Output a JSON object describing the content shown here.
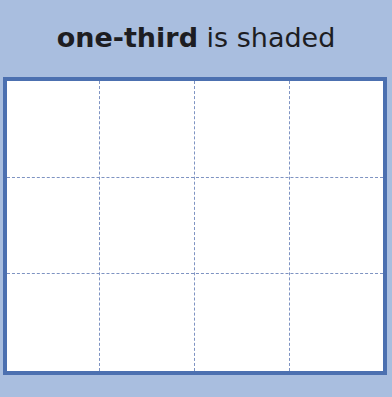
{
  "title": {
    "bold_part": "one-third",
    "rest": " is shaded"
  },
  "grid": {
    "rows": 3,
    "columns": 4,
    "shaded_cells": 0,
    "colors": {
      "background": "#a9bedf",
      "border": "#4c70b0",
      "dashed_lines": "#7e93c2",
      "cell_fill": "#ffffff"
    }
  }
}
